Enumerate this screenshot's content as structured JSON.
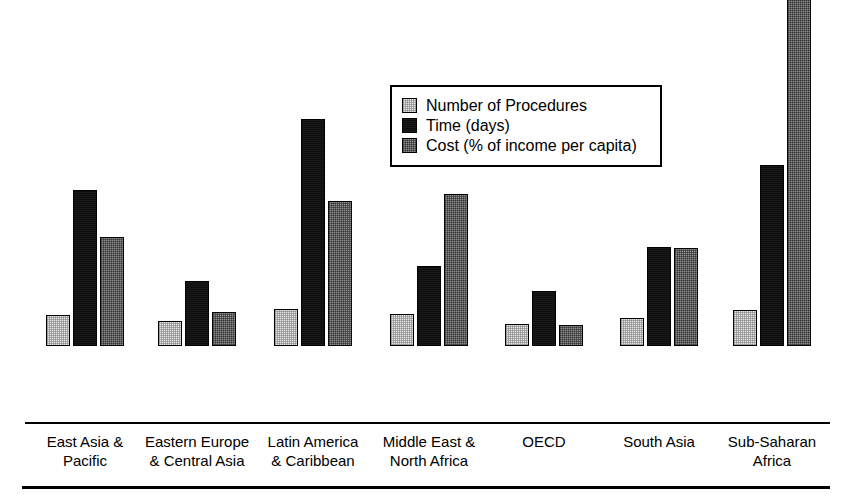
{
  "chart_data": {
    "type": "bar",
    "title": "",
    "xlabel": "",
    "ylabel": "",
    "ylim": [
      0,
      95.4
    ],
    "grid": false,
    "legend_position": "upper-center",
    "categories": [
      "East Asia &\nPacific",
      "Eastern Europe\n& Central Asia",
      "Latin America\n& Caribbean",
      "Middle East &\nNorth Africa",
      "OECD",
      "South Asia",
      "Sub-Saharan\nAfrica"
    ],
    "series": [
      {
        "name": "Number of Procedures",
        "values": [
          7.8,
          6.3,
          9.3,
          8.1,
          5.6,
          7.1,
          8.9
        ],
        "labels": [
          "7.8",
          "6.3",
          "9.3",
          "8.1",
          "5.6",
          "7.1",
          "8.9"
        ],
        "color": "#e9e9e9",
        "pattern": "light-dither"
      },
      {
        "name": "Time (days)",
        "values": [
          39,
          16.3,
          56.7,
          20,
          13.8,
          24.6,
          45.2
        ],
        "labels": [
          "39",
          "16.3",
          "56.7",
          "20",
          "13.8",
          "24.6",
          "45.2"
        ],
        "color": "#0d0d0d",
        "pattern": "solid-black"
      },
      {
        "name": "Cost (% of income per capita)",
        "values": [
          27.1,
          8.5,
          36.2,
          38,
          5.3,
          24.5,
          95.4
        ],
        "labels": [
          "27.1",
          "8.5",
          "36.2",
          "38",
          "5.3",
          "24.5",
          "95.4"
        ],
        "color": "#8f8f8f",
        "pattern": "medium-dither"
      }
    ]
  },
  "legend": {
    "items": [
      {
        "label": "Number of Procedures",
        "swatch": "light-gray-swatch"
      },
      {
        "label": "Time (days)",
        "swatch": "black-swatch"
      },
      {
        "label": "Cost (% of income per capita)",
        "swatch": "gray-swatch"
      }
    ]
  }
}
